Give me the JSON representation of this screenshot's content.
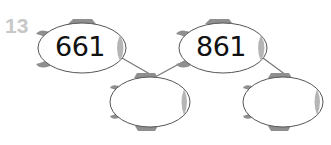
{
  "question": {
    "number": "13"
  },
  "fish": [
    {
      "id": "top-left",
      "value": "661",
      "cx": 82,
      "cy": 48,
      "rx": 44,
      "ry": 25
    },
    {
      "id": "top-right",
      "value": "861",
      "cx": 223,
      "cy": 48,
      "rx": 44,
      "ry": 25
    },
    {
      "id": "bottom-left",
      "value": "",
      "cx": 150,
      "cy": 102,
      "rx": 40,
      "ry": 25
    },
    {
      "id": "bottom-right",
      "value": "",
      "cx": 283,
      "cy": 102,
      "rx": 40,
      "ry": 25
    }
  ],
  "colors": {
    "fin": "#8f8f8f",
    "outline": "#555555",
    "line": "#777777",
    "number": "#c8c8c8"
  }
}
